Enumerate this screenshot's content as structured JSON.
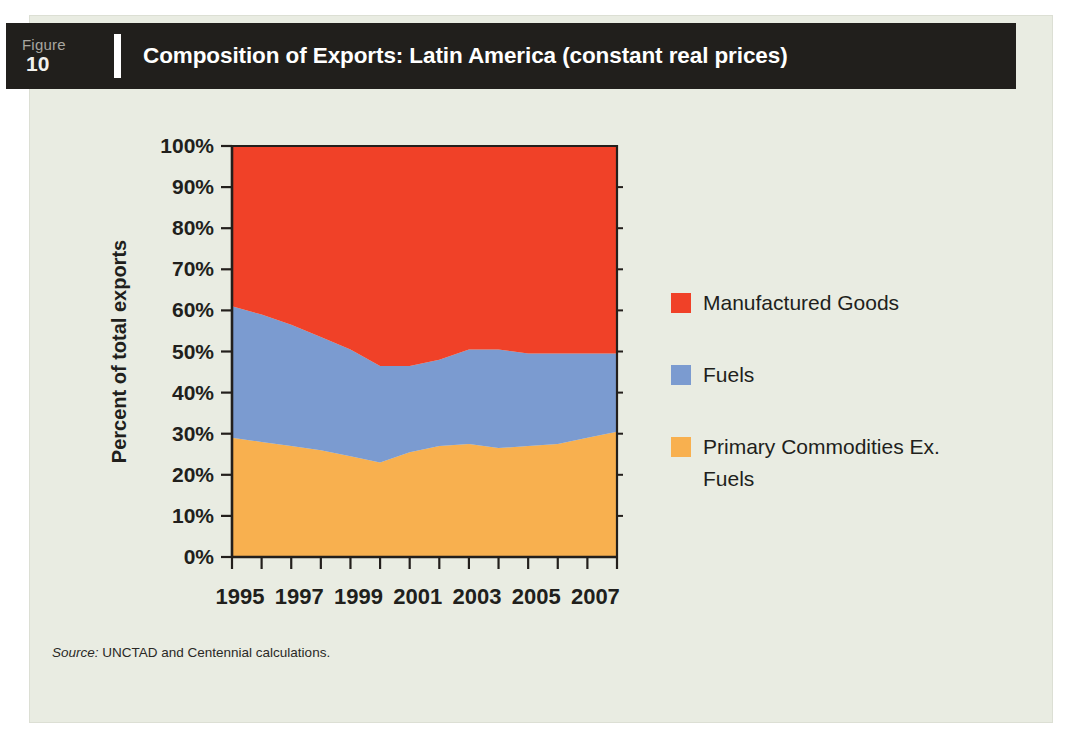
{
  "figure": {
    "tag_word": "Figure",
    "number": "10",
    "title": "Composition of Exports: Latin America (constant real prices)",
    "source_label": "Source:",
    "source_text": " UNCTAD and Centennial calculations."
  },
  "colors": {
    "page_background": "#ffffff",
    "card_background": "#e9ece2",
    "title_bar": "#211f1c",
    "title_text": "#ffffff",
    "axis": "#211f1c",
    "manufactured_goods": "#f04128",
    "fuels": "#7b9bd0",
    "primary_commodities": "#f8b04f"
  },
  "legend": {
    "position": "right",
    "entries": [
      {
        "label": "Manufactured Goods",
        "color": "#f04128"
      },
      {
        "label": "Fuels",
        "color": "#7b9bd0"
      },
      {
        "label": "Primary Commodities Ex. Fuels",
        "color": "#f8b04f"
      }
    ]
  },
  "chart_data": {
    "type": "area",
    "stacked": true,
    "normalized": true,
    "title": "Composition of Exports: Latin America (constant real prices)",
    "xlabel": "",
    "ylabel": "Percent of total exports",
    "ylim": [
      0,
      100
    ],
    "ytick_labels": [
      "0%",
      "10%",
      "20%",
      "30%",
      "40%",
      "50%",
      "60%",
      "70%",
      "80%",
      "90%",
      "100%"
    ],
    "ytick_values": [
      0,
      10,
      20,
      30,
      40,
      50,
      60,
      70,
      80,
      90,
      100
    ],
    "grid": false,
    "x": [
      1995,
      1996,
      1997,
      1998,
      1999,
      2000,
      2001,
      2002,
      2003,
      2004,
      2005,
      2006,
      2007,
      2008
    ],
    "xtick_values": [
      1995,
      1996,
      1997,
      1998,
      1999,
      2000,
      2001,
      2002,
      2003,
      2004,
      2005,
      2006,
      2007,
      2008
    ],
    "xtick_labels_shown": [
      "1995",
      "1997",
      "1999",
      "2001",
      "2003",
      "2005",
      "2007"
    ],
    "xtick_labels_shown_values": [
      1995,
      1997,
      1999,
      2001,
      2003,
      2005,
      2007
    ],
    "xlim": [
      1995,
      2008
    ],
    "stack_order_bottom_to_top": [
      "Primary Commodities Ex. Fuels",
      "Fuels",
      "Manufactured Goods"
    ],
    "series": [
      {
        "name": "Primary Commodities Ex. Fuels",
        "color": "#f8b04f",
        "values": [
          29.0,
          28.0,
          27.0,
          26.0,
          24.5,
          23.0,
          25.5,
          27.0,
          27.5,
          26.5,
          27.0,
          27.5,
          29.0,
          30.5
        ]
      },
      {
        "name": "Fuels",
        "color": "#7b9bd0",
        "values": [
          32.0,
          31.0,
          29.5,
          27.5,
          26.0,
          23.5,
          21.0,
          21.0,
          23.0,
          24.0,
          22.5,
          22.0,
          20.5,
          19.0
        ]
      },
      {
        "name": "Manufactured Goods",
        "color": "#f04128",
        "values": [
          39.0,
          41.0,
          43.5,
          46.5,
          49.5,
          53.5,
          53.5,
          52.0,
          49.5,
          49.5,
          50.5,
          50.5,
          50.5,
          50.5
        ]
      }
    ],
    "cumulative_top_primary": [
      29.0,
      28.0,
      27.0,
      26.0,
      24.5,
      23.0,
      25.5,
      27.0,
      27.5,
      26.5,
      27.0,
      27.5,
      29.0,
      30.5
    ],
    "cumulative_top_fuels": [
      61.0,
      59.0,
      56.5,
      53.5,
      50.5,
      46.5,
      46.5,
      48.0,
      50.5,
      50.5,
      49.5,
      49.5,
      49.5,
      49.5
    ]
  }
}
